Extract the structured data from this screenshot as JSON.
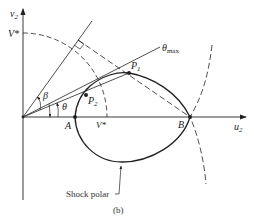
{
  "figure": {
    "caption": "(b)",
    "axes": {
      "vertical_label": "v",
      "vertical_sub": "2",
      "horizontal_label": "u",
      "horizontal_sub": "2"
    },
    "labels": {
      "vstar_vertical": "V*",
      "vstar_horizontal": "V*",
      "point_a": "A",
      "point_b": "B",
      "p1": "P",
      "p1_sub": "1",
      "p2": "P",
      "p2_sub": "2",
      "beta": "β",
      "theta": "θ",
      "theta_max": "θ",
      "theta_max_sub": "max",
      "shock_polar": "Shock polar"
    },
    "colors": {
      "ink": "#222222",
      "background": "#ffffff"
    }
  }
}
